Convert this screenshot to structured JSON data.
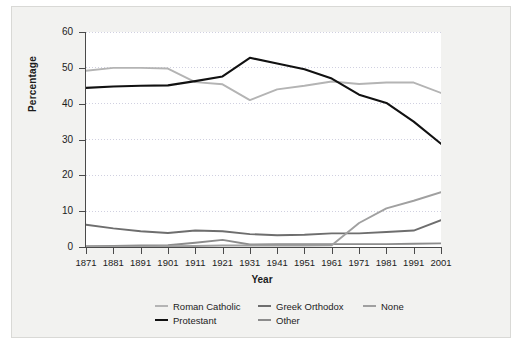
{
  "chart_data": {
    "type": "line",
    "title": "",
    "xlabel": "Year",
    "ylabel": "Percentage",
    "categories": [
      1871,
      1881,
      1891,
      1901,
      1911,
      1921,
      1931,
      1941,
      1951,
      1961,
      1971,
      1981,
      1991,
      2001
    ],
    "x": [
      "1871",
      "1881",
      "1891",
      "1901",
      "1911",
      "1921",
      "1931",
      "1941",
      "1951",
      "1961",
      "1971",
      "1981",
      "1991",
      "2001"
    ],
    "xlim": [
      1871,
      2001
    ],
    "ylim": [
      0,
      60
    ],
    "yticks": [
      0,
      10,
      20,
      30,
      40,
      50,
      60
    ],
    "ytick_labels": [
      "0",
      "10",
      "20",
      "30",
      "40",
      "50",
      "60"
    ],
    "grid": "horizontal-dotted",
    "legend_position": "bottom",
    "series": [
      {
        "name": "Roman Catholic",
        "color": "#b4b4b4",
        "values": [
          49.2,
          50.0,
          50.0,
          49.8,
          46.0,
          45.4,
          41.0,
          44.0,
          45.0,
          46.2,
          45.5,
          45.9,
          45.9,
          43.0
        ]
      },
      {
        "name": "Protestant",
        "color": "#111111",
        "values": [
          44.4,
          44.8,
          45.0,
          45.1,
          46.3,
          47.6,
          52.8,
          51.2,
          49.6,
          47.0,
          42.5,
          40.2,
          35.0,
          28.8
        ]
      },
      {
        "name": "Greek Orthodox",
        "color": "#6e6e6e",
        "values": [
          6.2,
          5.2,
          4.4,
          3.9,
          4.6,
          4.4,
          3.6,
          3.3,
          3.4,
          3.8,
          3.8,
          4.2,
          4.6,
          7.5
        ]
      },
      {
        "name": "Other",
        "color": "#8c8c8c",
        "values": [
          0.2,
          0.3,
          0.4,
          0.5,
          1.2,
          2.0,
          0.7,
          0.8,
          0.8,
          0.8,
          0.8,
          0.8,
          0.9,
          1.0
        ]
      },
      {
        "name": "None",
        "color": "#a0a0a0",
        "values": [
          0.1,
          0.1,
          0.1,
          0.2,
          0.3,
          0.4,
          0.4,
          0.4,
          0.4,
          0.5,
          6.7,
          10.8,
          12.9,
          15.3
        ]
      }
    ]
  },
  "axes": {
    "y_title": "Percentage",
    "x_title": "Year",
    "y_tick_labels": [
      "60",
      "50",
      "40",
      "30",
      "20",
      "10",
      "0"
    ],
    "x_tick_labels": [
      "1871",
      "1881",
      "1891",
      "1901",
      "1911",
      "1921",
      "1931",
      "1941",
      "1951",
      "1961",
      "1971",
      "1981",
      "1991",
      "2001"
    ]
  },
  "legend": {
    "row1": [
      {
        "label": "Roman Catholic",
        "color": "#b4b4b4"
      },
      {
        "label": "Greek Orthodox",
        "color": "#6e6e6e"
      },
      {
        "label": "None",
        "color": "#a0a0a0"
      }
    ],
    "row2": [
      {
        "label": "Protestant",
        "color": "#111111"
      },
      {
        "label": "Other",
        "color": "#8c8c8c"
      }
    ]
  },
  "colors": {
    "panel_background": "#f2f2f0",
    "plot_background": "#ffffff",
    "axis": "#4a4a4a",
    "gridline": "#d0d0e0",
    "text": "#1c1c1c"
  }
}
